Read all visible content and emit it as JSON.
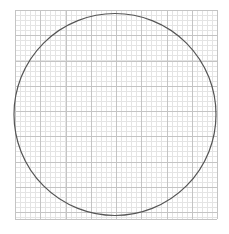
{
  "canvas": {
    "width": 229,
    "height": 234,
    "background": "#ffffff"
  },
  "grid": {
    "x0": 15,
    "y0": 10,
    "x1": 217,
    "y1": 219,
    "major_step": 25.25,
    "minor_divisions": 5,
    "major_color": "#c4c4c4",
    "minor_color": "#e4e4e4"
  },
  "circle": {
    "cx": 115,
    "cy": 114.5,
    "r": 101,
    "stroke": "#555555",
    "stroke_width": 1.2
  }
}
